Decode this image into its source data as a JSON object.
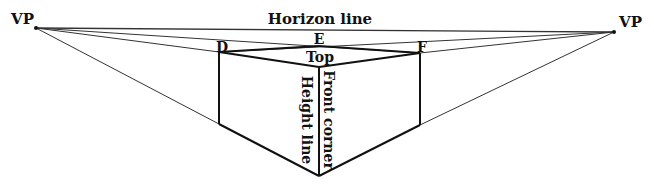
{
  "labels": {
    "vp_left": "VP",
    "vp_right": "VP",
    "horizon": "Horizon line",
    "point_d": "D",
    "point_e": "E",
    "point_f": "F",
    "top": "Top",
    "height_line": "Height line",
    "front_corner": "Front corner"
  },
  "colors": {
    "ink": "#111111",
    "thin_line": "#333333",
    "background": "#ffffff"
  }
}
